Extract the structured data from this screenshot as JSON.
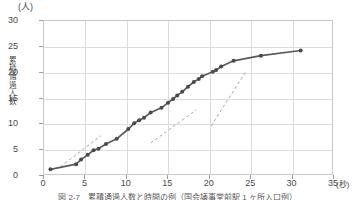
{
  "chart_data": {
    "type": "line",
    "title": "",
    "caption": "図 2-7　累積通過人数と時間の例（国会議事堂前駅 1 ヶ所入口例）",
    "xlabel": "",
    "ylabel": "累積通過人数",
    "x_unit_label": "(秒)",
    "y_unit_label": "(人)",
    "xlim": [
      0,
      35
    ],
    "ylim": [
      0,
      30
    ],
    "xticks": [
      0,
      5,
      10,
      15,
      20,
      25,
      30,
      35
    ],
    "yticks": [
      0,
      5,
      10,
      15,
      20,
      25,
      30
    ],
    "grid": true,
    "legend": "none",
    "series": [
      {
        "name": "累積通過人数",
        "color": "#5a5a5a",
        "marker": "circle",
        "x": [
          0.9,
          4.0,
          4.6,
          5.4,
          6.1,
          6.7,
          7.6,
          8.9,
          10.3,
          11.0,
          11.6,
          12.2,
          13.0,
          14.3,
          15.1,
          15.7,
          16.2,
          16.8,
          17.5,
          18.2,
          18.8,
          19.2,
          20.5,
          20.9,
          21.5,
          23.0,
          26.3,
          31.1
        ],
        "y": [
          1.1,
          2.1,
          3.0,
          3.9,
          4.8,
          5.1,
          6.0,
          7.0,
          8.9,
          10.0,
          10.6,
          11.1,
          12.1,
          13.0,
          14.0,
          14.7,
          15.4,
          16.1,
          17.1,
          18.0,
          18.6,
          19.1,
          20.0,
          20.3,
          21.0,
          22.1,
          23.1,
          24.1
        ]
      }
    ],
    "trend_lines": [
      {
        "name": "trend-segment-1",
        "x0": 2.1,
        "y0": 1.6,
        "x1": 7.0,
        "y1": 7.6,
        "style": "dashed"
      },
      {
        "name": "trend-segment-2",
        "x0": 13.0,
        "y0": 6.2,
        "x1": 18.5,
        "y1": 12.6,
        "style": "dashed"
      },
      {
        "name": "trend-segment-3",
        "x0": 20.3,
        "y0": 9.5,
        "x1": 24.6,
        "y1": 20.3,
        "style": "dashed"
      }
    ]
  },
  "axis": {
    "y_unit": "(人)",
    "y_title_chars": [
      "累",
      "積",
      "通",
      "過",
      "人",
      "数"
    ],
    "x_unit": "(秒)",
    "yticks": [
      "30",
      "25",
      "20",
      "15",
      "10",
      "5",
      "0"
    ],
    "xticks": [
      "0",
      "5",
      "10",
      "15",
      "20",
      "25",
      "30",
      "35"
    ]
  },
  "colors": {
    "line": "#5a5a5a",
    "marker": "#4a4a4a",
    "grid": "#dcdcdc",
    "frame": "#c9c9c9",
    "dashed": "#a8a8a8",
    "text": "#4a4a4a",
    "background": "#ffffff"
  }
}
